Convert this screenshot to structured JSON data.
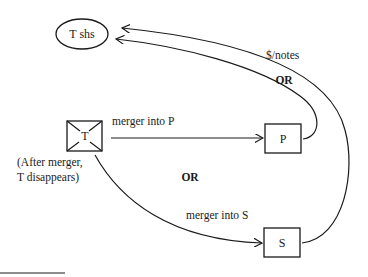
{
  "diagram": {
    "nodes": {
      "t_shareholders": {
        "label": "T shs",
        "shape": "ellipse"
      },
      "target": {
        "label": "T",
        "shape": "crossed-box"
      },
      "parent": {
        "label": "P",
        "shape": "box"
      },
      "subsidiary": {
        "label": "S",
        "shape": "box"
      }
    },
    "edges": {
      "merger_p": {
        "label": "merger into P",
        "from": "T",
        "to": "P"
      },
      "merger_s": {
        "label": "merger into S",
        "from": "T",
        "to": "S"
      },
      "consideration_p": {
        "label": "$/notes",
        "from": "P",
        "to": "T shs"
      },
      "consideration_s": {
        "from": "S",
        "to": "T shs"
      }
    },
    "annotations": {
      "after_merger_line1": "(After merger,",
      "after_merger_line2": "T disappears)",
      "or_middle": "OR",
      "or_top": "OR"
    },
    "colors": {
      "ink": "#1a1a1a",
      "background": "#ffffff"
    }
  }
}
